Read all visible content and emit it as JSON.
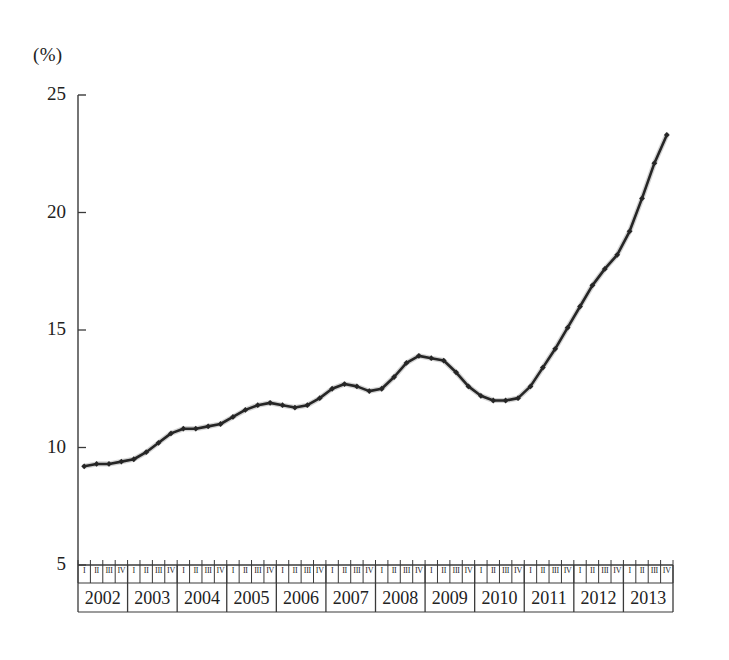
{
  "chart": {
    "unit_label": "(%)",
    "y_axis": {
      "ticks": [
        "25",
        "20",
        "15",
        "10",
        "5"
      ]
    },
    "x_axis": {
      "years": [
        "2002",
        "2003",
        "2004",
        "2005",
        "2006",
        "2007",
        "2008",
        "2009",
        "2010",
        "2011",
        "2012",
        "2013"
      ],
      "quarters": [
        "I",
        "II",
        "III",
        "IV"
      ]
    },
    "line_color": "#262626"
  },
  "chart_data": {
    "type": "line",
    "title": "",
    "subtitle": "",
    "xlabel": "",
    "ylabel": "(%)",
    "ylim": [
      5,
      25
    ],
    "grid": false,
    "legend": "none",
    "categories": [
      "2002 I",
      "2002 II",
      "2002 III",
      "2002 IV",
      "2003 I",
      "2003 II",
      "2003 III",
      "2003 IV",
      "2004 I",
      "2004 II",
      "2004 III",
      "2004 IV",
      "2005 I",
      "2005 II",
      "2005 III",
      "2005 IV",
      "2006 I",
      "2006 II",
      "2006 III",
      "2006 IV",
      "2007 I",
      "2007 II",
      "2007 III",
      "2007 IV",
      "2008 I",
      "2008 II",
      "2008 III",
      "2008 IV",
      "2009 I",
      "2009 II",
      "2009 III",
      "2009 IV",
      "2010 I",
      "2010 II",
      "2010 III",
      "2010 IV",
      "2011 I",
      "2011 II",
      "2011 III",
      "2011 IV",
      "2012 I",
      "2012 II",
      "2012 III",
      "2012 IV",
      "2013 I",
      "2013 II",
      "2013 III",
      "2013 IV"
    ],
    "values": [
      9.2,
      9.3,
      9.3,
      9.4,
      9.5,
      9.8,
      10.2,
      10.6,
      10.8,
      10.8,
      10.9,
      11.0,
      11.3,
      11.6,
      11.8,
      11.9,
      11.8,
      11.7,
      11.8,
      12.1,
      12.5,
      12.7,
      12.6,
      12.4,
      12.5,
      13.0,
      13.6,
      13.9,
      13.8,
      13.7,
      13.2,
      12.6,
      12.2,
      12.0,
      12.0,
      12.1,
      12.6,
      13.4,
      14.2,
      15.1,
      16.0,
      16.9,
      17.6,
      18.2,
      19.2,
      20.6,
      22.1,
      23.3
    ],
    "series": [
      {
        "name": "series-1",
        "values": [
          9.2,
          9.3,
          9.3,
          9.4,
          9.5,
          9.8,
          10.2,
          10.6,
          10.8,
          10.8,
          10.9,
          11.0,
          11.3,
          11.6,
          11.8,
          11.9,
          11.8,
          11.7,
          11.8,
          12.1,
          12.5,
          12.7,
          12.6,
          12.4,
          12.5,
          13.0,
          13.6,
          13.9,
          13.8,
          13.7,
          13.2,
          12.6,
          12.2,
          12.0,
          12.0,
          12.1,
          12.6,
          13.4,
          14.2,
          15.1,
          16.0,
          16.9,
          17.6,
          18.2,
          19.2,
          20.6,
          22.1,
          23.3
        ]
      }
    ]
  }
}
